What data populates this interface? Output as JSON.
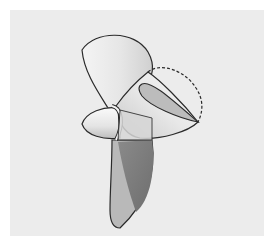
{
  "image": {
    "subject": "three-bladed propeller illustration",
    "style": "grayscale technical drawing",
    "annotation": "dashed outline showing trimmed blade tip",
    "colors": {
      "background": "#ffffff",
      "panel": "#ececec",
      "outline": "#2a2a2a",
      "blade_light": "#f2f2f2",
      "blade_mid": "#bdbdbd",
      "blade_dark": "#7d7d7d"
    }
  }
}
